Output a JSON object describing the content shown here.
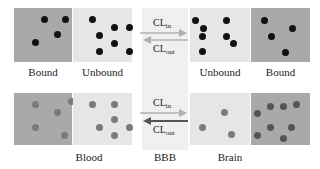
{
  "colors": {
    "bound_bg": "#a9a9a9",
    "unbound_bg": "#e6e6e6",
    "bbb_bg": "#f0f0f0",
    "dot_dark": "#111111",
    "dot_gray": "#7a7a7a",
    "arrow_light": "#b0b0b0",
    "arrow_dark": "#555555"
  },
  "top_row": {
    "left_bound_label": "Bound",
    "left_unbound_label": "Unbound",
    "right_unbound_label": "Unbound",
    "right_bound_label": "Bound",
    "cl_in": "CL",
    "cl_in_sub": "in",
    "cl_out": "CL",
    "cl_out_sub": "out"
  },
  "bottom_row": {
    "blood_label": "Blood",
    "bbb_label": "BBB",
    "brain_label": "Brain",
    "cl_in": "CL",
    "cl_in_sub": "in",
    "cl_out": "CL",
    "cl_out_sub": "out"
  }
}
